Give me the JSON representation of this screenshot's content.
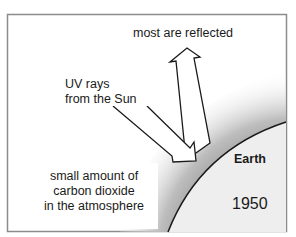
{
  "diagram": {
    "type": "greenhouse-effect-illustration",
    "labels": {
      "reflected": "most are reflected",
      "uv_line1": "UV rays",
      "uv_line2": "from the Sun",
      "co2_line1": "small amount of",
      "co2_line2": "carbon dioxide",
      "co2_line3": "in the atmosphere",
      "earth": "Earth",
      "year": "1950"
    },
    "colors": {
      "frame": "#8c8c8c",
      "outline": "#1a1a1a",
      "earth_fill": "#eeeeee",
      "atmosphere_dark": "#9a9a9a",
      "arrow_fill": "#ffffff"
    },
    "arrows": [
      {
        "name": "incoming-uv-arrow",
        "direction": "down-right",
        "meaning": "UV rays from the Sun"
      },
      {
        "name": "reflected-arrow",
        "direction": "up",
        "meaning": "most are reflected"
      }
    ]
  }
}
